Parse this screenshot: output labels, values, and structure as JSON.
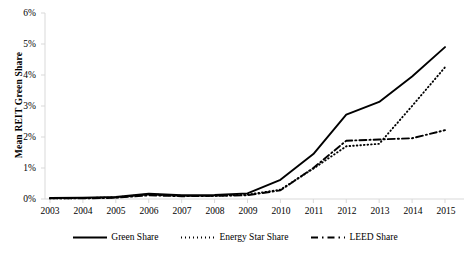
{
  "chart_data": {
    "type": "line",
    "title": "",
    "xlabel": "",
    "ylabel": "Mean REIT Green Share",
    "x": [
      2003,
      2004,
      2005,
      2006,
      2007,
      2008,
      2009,
      2010,
      2011,
      2012,
      2013,
      2014,
      2015
    ],
    "categories": [
      "2003",
      "2004",
      "2005",
      "2006",
      "2007",
      "2008",
      "2009",
      "2010",
      "2011",
      "2012",
      "2013",
      "2014",
      "2015"
    ],
    "xlim": [
      2003,
      2015
    ],
    "ylim": [
      0,
      6
    ],
    "y_unit": "%",
    "y_ticks": [
      0,
      1,
      2,
      3,
      4,
      5,
      6
    ],
    "y_tick_labels": [
      "0%",
      "1%",
      "2%",
      "3%",
      "4%",
      "5%",
      "6%"
    ],
    "grid": false,
    "legend_position": "bottom",
    "series": [
      {
        "name": "Green Share",
        "style": "solid",
        "color": "#000000",
        "values": [
          0.03,
          0.04,
          0.07,
          0.17,
          0.12,
          0.13,
          0.18,
          0.62,
          1.45,
          2.72,
          3.13,
          3.95,
          4.9
        ]
      },
      {
        "name": "Energy Star Share",
        "style": "dotted",
        "color": "#000000",
        "values": [
          0.02,
          0.03,
          0.05,
          0.15,
          0.1,
          0.1,
          0.14,
          0.3,
          0.98,
          1.7,
          1.78,
          3.0,
          4.25
        ]
      },
      {
        "name": "LEED Share",
        "style": "dash-dot",
        "color": "#000000",
        "values": [
          0.02,
          0.02,
          0.04,
          0.12,
          0.09,
          0.1,
          0.12,
          0.28,
          1.0,
          1.88,
          1.92,
          1.96,
          2.22
        ]
      }
    ]
  },
  "axes": {
    "y_title": "Mean REIT Green Share",
    "y_tick_labels": [
      "6%",
      "5%",
      "4%",
      "3%",
      "2%",
      "1%",
      "0%"
    ],
    "x_tick_labels": [
      "2003",
      "2004",
      "2005",
      "2006",
      "2007",
      "2008",
      "2009",
      "2010",
      "2011",
      "2012",
      "2013",
      "2014",
      "2015"
    ]
  },
  "legend": {
    "items": [
      {
        "label": "Green Share",
        "style": "solid"
      },
      {
        "label": "Energy Star Share",
        "style": "dotted"
      },
      {
        "label": "LEED Share",
        "style": "dash-dot"
      }
    ]
  }
}
